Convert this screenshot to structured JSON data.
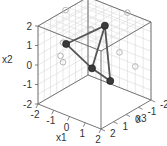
{
  "chart_data": {
    "type": "scatter3d",
    "title": "",
    "axes": {
      "x1": {
        "label": "x1",
        "range": [
          -2,
          2
        ],
        "ticks": [
          -2,
          -1,
          0,
          1,
          2
        ]
      },
      "x2": {
        "label": "x2",
        "range": [
          -2,
          2
        ],
        "ticks": [
          -2,
          -1,
          0,
          1,
          2
        ]
      },
      "x3": {
        "label": "x3",
        "range": [
          -2,
          2
        ],
        "ticks": [
          -2,
          -1,
          0,
          1,
          2
        ]
      }
    },
    "grid": true,
    "points": [
      {
        "name": "A",
        "x1": -1.8,
        "x2": 0.4,
        "x3": 0.0
      },
      {
        "name": "B",
        "x1": 0.0,
        "x2": -0.2,
        "x3": 0.2
      },
      {
        "name": "C",
        "x1": 1.0,
        "x2": -0.6,
        "x3": 0.0
      },
      {
        "name": "D",
        "x1": 0.5,
        "x2": 2.0,
        "x3": -0.2
      }
    ],
    "edges": [
      [
        "A",
        "D"
      ],
      [
        "A",
        "B"
      ],
      [
        "B",
        "C"
      ],
      [
        "C",
        "D"
      ],
      [
        "B",
        "D"
      ]
    ],
    "shadow_projections": true,
    "colors": {
      "point": "#3a3a3a",
      "edge": "#555555",
      "shadow": "#b5b5b5",
      "grid": "#d0d0d0",
      "box": "#666666"
    }
  }
}
